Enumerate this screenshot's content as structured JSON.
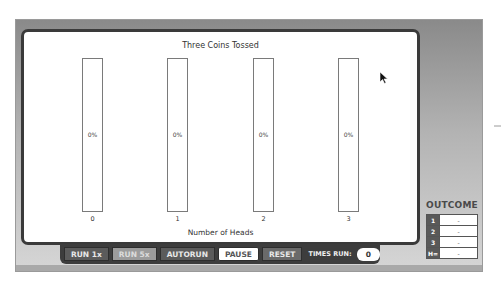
{
  "chart": {
    "title": "Three Coins Tossed",
    "x_label": "Number of Heads",
    "bars": [
      {
        "category": "0",
        "percent_label": "0%",
        "value": 0
      },
      {
        "category": "1",
        "percent_label": "0%",
        "value": 0
      },
      {
        "category": "2",
        "percent_label": "0%",
        "value": 0
      },
      {
        "category": "3",
        "percent_label": "0%",
        "value": 0
      }
    ]
  },
  "chart_data": {
    "type": "bar",
    "title": "Three Coins Tossed",
    "xlabel": "Number of Heads",
    "ylabel": "",
    "categories": [
      "0",
      "1",
      "2",
      "3"
    ],
    "values": [
      0,
      0,
      0,
      0
    ],
    "value_labels": [
      "0%",
      "0%",
      "0%",
      "0%"
    ],
    "ylim": [
      0,
      100
    ],
    "grid": false
  },
  "controls": {
    "run1_label": "RUN 1x",
    "run5_label": "RUN 5x",
    "autorun_label": "AUTORUN",
    "pause_label": "PAUSE",
    "reset_label": "RESET",
    "times_run_label": "TIMES RUN:",
    "times_run_value": "0"
  },
  "outcome": {
    "title": "OUTCOME",
    "rows": [
      {
        "key": "1",
        "value": "-"
      },
      {
        "key": "2",
        "value": "-"
      },
      {
        "key": "3",
        "value": "-"
      },
      {
        "key": "H=",
        "value": "-"
      }
    ]
  },
  "colors": {
    "frame_dark": "#3a3a3a",
    "button_bg": "#5b5b5b",
    "button_active_bg": "#9c9c9c",
    "outcome_key_bg": "#595959"
  }
}
